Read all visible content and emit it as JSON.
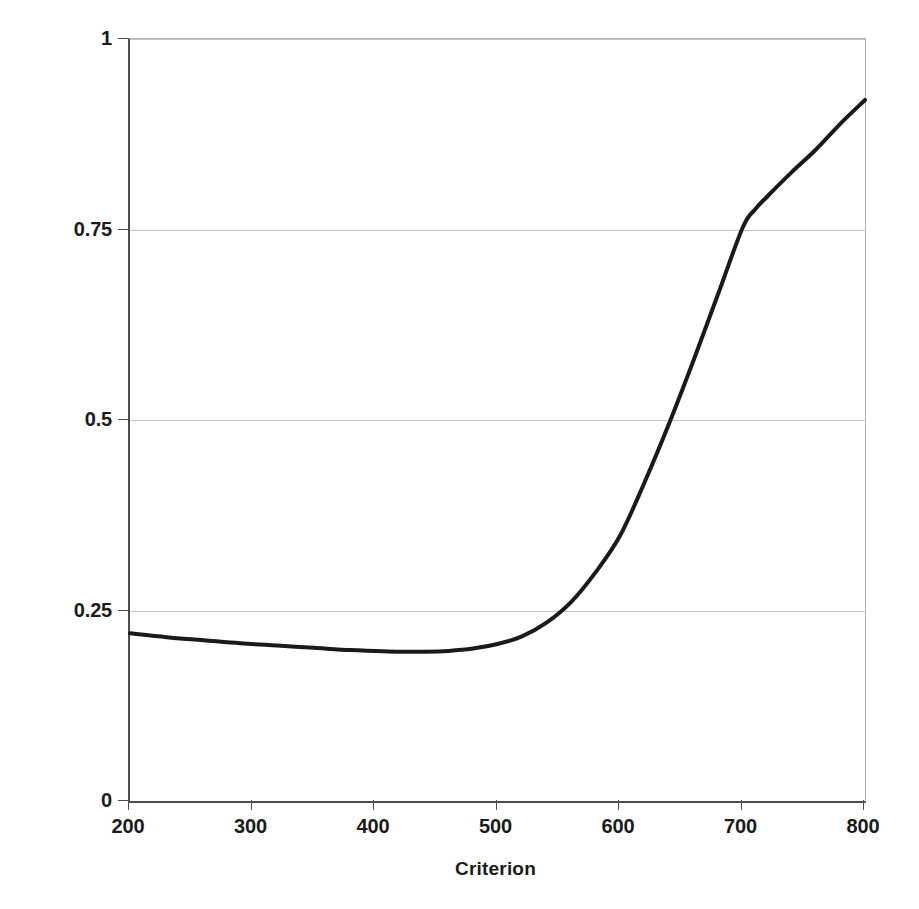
{
  "chart_data": {
    "type": "line",
    "title": "",
    "xlabel": "Criterion",
    "ylabel": "Probability of correct response",
    "xlim": [
      200,
      800
    ],
    "ylim": [
      0,
      1
    ],
    "xticks": [
      200,
      300,
      400,
      500,
      600,
      700,
      800
    ],
    "yticks": [
      0,
      0.25,
      0.5,
      0.75,
      1
    ],
    "xtick_labels": [
      "200",
      "300",
      "400",
      "500",
      "600",
      "700",
      "800"
    ],
    "ytick_labels": [
      "0",
      "0.25",
      "0.5",
      "0.75",
      "1"
    ],
    "grid": "horizontal",
    "legend": "none",
    "series": [
      {
        "name": "Probability of correct response",
        "color": "#1a1a1a",
        "line_width": 4,
        "x": [
          200,
          230,
          260,
          290,
          320,
          350,
          380,
          400,
          420,
          440,
          460,
          480,
          500,
          520,
          540,
          560,
          580,
          600,
          620,
          640,
          660,
          680,
          700,
          710,
          720,
          740,
          760,
          780,
          800
        ],
        "y": [
          0.22,
          0.215,
          0.211,
          0.207,
          0.204,
          0.201,
          0.198,
          0.197,
          0.196,
          0.196,
          0.197,
          0.2,
          0.206,
          0.216,
          0.234,
          0.261,
          0.3,
          0.348,
          0.418,
          0.495,
          0.578,
          0.665,
          0.752,
          0.776,
          0.793,
          0.825,
          0.855,
          0.889,
          0.92
        ]
      }
    ]
  },
  "axes": {
    "x_title": "Criterion",
    "y_title": "Probability of correct response"
  },
  "colors": {
    "curve": "#1a1a1a",
    "gridline": "#c4c4c4",
    "axis": "#4d4d4d",
    "background": "#ffffff"
  }
}
